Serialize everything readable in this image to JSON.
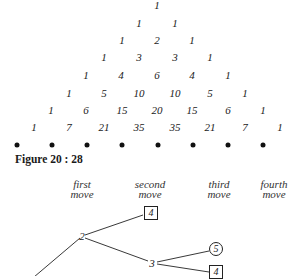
{
  "triangle": {
    "rows": [
      [
        "1"
      ],
      [
        "1",
        "1"
      ],
      [
        "1",
        "2",
        "1"
      ],
      [
        "1",
        "3",
        "3",
        "1"
      ],
      [
        "1",
        "4",
        "6",
        "4",
        "1"
      ],
      [
        "1",
        "5",
        "10",
        "10",
        "5",
        "1"
      ],
      [
        "1",
        "6",
        "15",
        "20",
        "15",
        "6",
        "1"
      ],
      [
        "1",
        "7",
        "21",
        "35",
        "35",
        "21",
        "7",
        "1"
      ]
    ],
    "dot_count": 8
  },
  "caption": "Figure 20 : 28",
  "moves": [
    {
      "line1": "first",
      "line2": "move"
    },
    {
      "line1": "second",
      "line2": "move"
    },
    {
      "line1": "third",
      "line2": "move"
    },
    {
      "line1": "fourth",
      "line2": "move"
    }
  ],
  "tree": {
    "nodes": {
      "n2": "2",
      "n3": "3",
      "box_top": "4",
      "circle": "5",
      "box_bottom": "4"
    }
  }
}
